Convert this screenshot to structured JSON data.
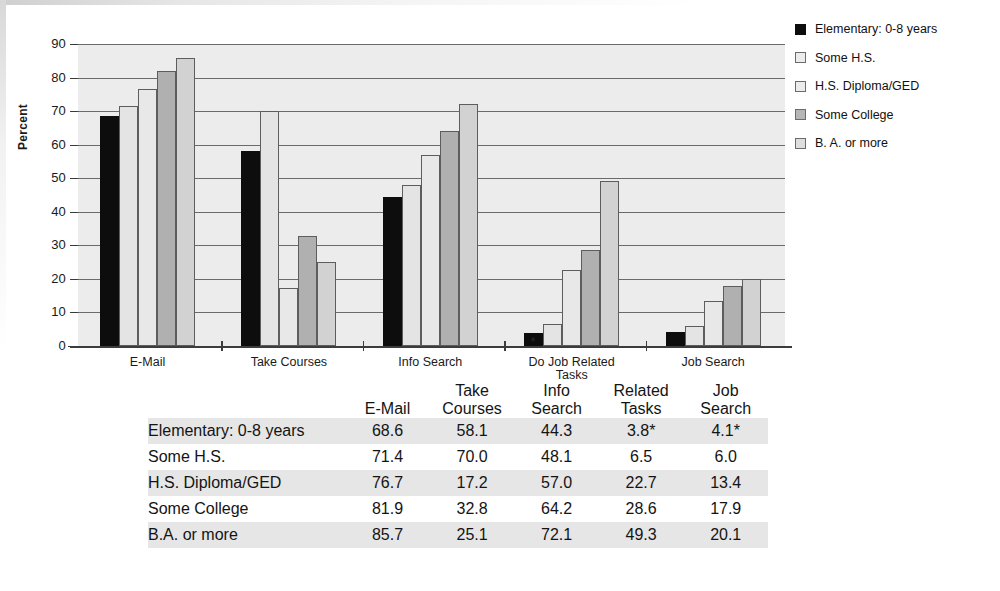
{
  "chart_data": {
    "type": "bar",
    "title": "",
    "xlabel": "",
    "ylabel": "Percent",
    "ylim": [
      0,
      90
    ],
    "yticks": [
      0,
      10,
      20,
      30,
      40,
      50,
      60,
      70,
      80,
      90
    ],
    "grid": true,
    "legend_position": "right",
    "categories": [
      "E-Mail",
      "Take Courses",
      "Info Search",
      "Do Job Related\nTasks",
      "Job Search"
    ],
    "series": [
      {
        "name": "Elementary: 0-8 years",
        "color": "#0d0d0d",
        "values": [
          68.6,
          58.1,
          44.3,
          3.8,
          4.1
        ]
      },
      {
        "name": "Some H.S.",
        "color": "#e4e4e4",
        "values": [
          71.4,
          70.0,
          48.1,
          6.5,
          6.0
        ]
      },
      {
        "name": "H.S. Diploma/GED",
        "color": "#e8e8e8",
        "values": [
          76.7,
          17.2,
          57.0,
          22.7,
          13.4
        ]
      },
      {
        "name": "Some College",
        "color": "#b0b0b0",
        "values": [
          81.9,
          32.8,
          64.2,
          28.6,
          17.9
        ]
      },
      {
        "name": "B. A. or more",
        "color": "#d2d2d2",
        "values": [
          85.7,
          25.1,
          72.1,
          49.3,
          20.1
        ]
      }
    ],
    "annotations": [
      {
        "text": "*",
        "series": "Elementary: 0-8 years",
        "category": "Do Job Related\nTasks"
      },
      {
        "text": "*",
        "series": "Elementary: 0-8 years",
        "category": "Job Search"
      }
    ]
  },
  "legend": {
    "items": [
      {
        "label": "Elementary: 0-8 years",
        "swatch": "s0"
      },
      {
        "label": "Some H.S.",
        "swatch": "s1"
      },
      {
        "label": "H.S. Diploma/GED",
        "swatch": "s2"
      },
      {
        "label": "Some College",
        "swatch": "s3"
      },
      {
        "label": "B. A. or more",
        "swatch": "s4"
      }
    ]
  },
  "axis": {
    "y_title": "Percent",
    "y_ticks": [
      "90",
      "80",
      "70",
      "60",
      "50",
      "40",
      "30",
      "20",
      "10",
      "0"
    ],
    "x_categories": [
      "E-Mail",
      "Take Courses",
      "Info Search",
      "Do Job Related\nTasks",
      "Job Search"
    ]
  },
  "table": {
    "corner_header": "",
    "columns": [
      "E-Mail",
      "Take\nCourses",
      "Info\nSearch",
      "Related\nTasks",
      "Job\nSearch"
    ],
    "rows": [
      {
        "label": "Elementary: 0-8 years",
        "values": [
          "68.6",
          "58.1",
          "44.3",
          "3.8*",
          "4.1*"
        ]
      },
      {
        "label": "Some H.S.",
        "values": [
          "71.4",
          "70.0",
          "48.1",
          "6.5",
          "6.0"
        ]
      },
      {
        "label": "H.S. Diploma/GED",
        "values": [
          "76.7",
          "17.2",
          "57.0",
          "22.7",
          "13.4"
        ]
      },
      {
        "label": "Some College",
        "values": [
          "81.9",
          "32.8",
          "64.2",
          "28.6",
          "17.9"
        ]
      },
      {
        "label": "B.A. or more",
        "values": [
          "85.7",
          "25.1",
          "72.1",
          "49.3",
          "20.1"
        ]
      }
    ]
  }
}
